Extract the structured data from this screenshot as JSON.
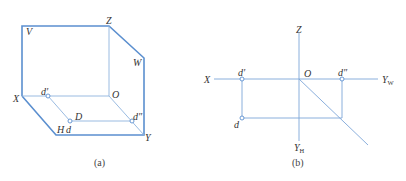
{
  "figure_a": {
    "caption": "(a)",
    "planes": {
      "V": "V",
      "W": "W",
      "H": "H"
    },
    "axes": {
      "X": "X",
      "Y": "Y",
      "Z": "Z",
      "O": "O"
    },
    "points": {
      "D": "D",
      "d_prime": "d′",
      "d": "d",
      "d_double_prime": "d″"
    }
  },
  "figure_b": {
    "caption": "(b)",
    "axes": {
      "X": "X",
      "Z": "Z",
      "O": "O",
      "Y_W_main": "Y",
      "Y_W_sub": "W",
      "Y_H_main": "Y",
      "Y_H_sub": "H"
    },
    "points": {
      "d_prime": "d′",
      "d": "d",
      "d_double_prime": "d″"
    }
  },
  "colors": {
    "line": "#5b8fcf",
    "thin_line": "#8fb3de",
    "text": "#333333"
  }
}
